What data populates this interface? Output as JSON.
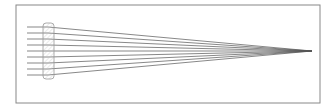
{
  "diagram": {
    "type": "optics-ray-diagram",
    "frame": {
      "x": 16,
      "y": 5,
      "w": 304,
      "h": 98,
      "stroke": "#888888"
    },
    "lens": {
      "x": 43,
      "y": 23,
      "w": 11,
      "h": 56,
      "stroke": "#999999",
      "fill": "#f2f2f2"
    },
    "rays": {
      "count": 9,
      "start_x": 27,
      "lens_x": 48,
      "y_positions": [
        27,
        33,
        39,
        45,
        51,
        57,
        63,
        69,
        75
      ],
      "focus": {
        "x": 312,
        "y": 51
      },
      "color": "#555555"
    }
  }
}
